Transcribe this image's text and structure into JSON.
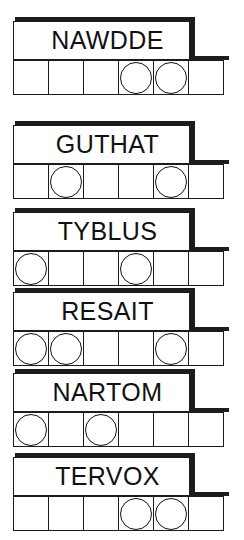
{
  "sheet": {
    "title": "Word puzzle worksheet",
    "cells_per_row": 6,
    "ink_color": "#1c1c1c",
    "paper_color": "#ffffff"
  },
  "blocks": [
    {
      "word": "NAWDDE",
      "top": 21,
      "marked_cells": [
        4,
        5
      ],
      "cells": [
        "",
        "",
        "",
        "",
        "",
        ""
      ]
    },
    {
      "word": "GUTHAT",
      "top": 125,
      "marked_cells": [
        2,
        5
      ],
      "cells": [
        "",
        "",
        "",
        "",
        "",
        ""
      ]
    },
    {
      "word": "TYBLUS",
      "top": 212,
      "marked_cells": [
        1,
        4
      ],
      "cells": [
        "",
        "",
        "",
        "",
        "",
        ""
      ]
    },
    {
      "word": "RESAIT",
      "top": 292,
      "marked_cells": [
        1,
        2,
        5
      ],
      "cells": [
        "",
        "",
        "",
        "",
        "",
        ""
      ]
    },
    {
      "word": "NARTOM",
      "top": 373,
      "marked_cells": [
        1,
        3
      ],
      "cells": [
        "",
        "",
        "",
        "",
        "",
        ""
      ]
    },
    {
      "word": "TERVOX",
      "top": 457,
      "marked_cells": [
        4,
        5
      ],
      "cells": [
        "",
        "",
        "",
        "",
        "",
        ""
      ]
    }
  ]
}
